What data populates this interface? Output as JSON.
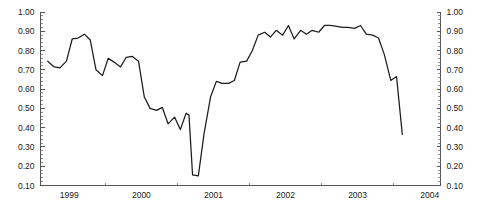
{
  "chart_data": {
    "type": "line",
    "title": "",
    "subtitle": "",
    "xlabel": "",
    "ylabel": "",
    "xlim": [
      1998.6,
      2004.15
    ],
    "ylim": [
      0.1,
      1.0
    ],
    "grid": false,
    "legend": null,
    "y_ticks": [
      "1.00",
      "0.90",
      "0.80",
      "0.70",
      "0.60",
      "0.50",
      "0.40",
      "0.30",
      "0.20",
      "0.10"
    ],
    "y_tick_values": [
      1.0,
      0.9,
      0.8,
      0.7,
      0.6,
      0.5,
      0.4,
      0.3,
      0.2,
      0.1
    ],
    "y_minor_step": 0.02,
    "right_axis_ticks": [
      "1.00",
      "0.90",
      "0.80",
      "0.70",
      "0.60",
      "0.50",
      "0.40",
      "0.30",
      "0.20",
      "0.10"
    ],
    "x_ticks": [
      "1999",
      "2000",
      "2001",
      "2002",
      "2003",
      "2004"
    ],
    "x_tick_values": [
      1999,
      2000,
      2001,
      2002,
      2003,
      2004
    ],
    "series": [
      {
        "name": "series-1",
        "color": "#1d1d1d",
        "x": [
          1998.7,
          1998.79,
          1998.87,
          1998.96,
          1999.04,
          1999.12,
          1999.21,
          1999.29,
          1999.37,
          1999.46,
          1999.54,
          1999.62,
          1999.71,
          1999.79,
          1999.87,
          1999.96,
          2000.04,
          2000.12,
          2000.21,
          2000.29,
          2000.37,
          2000.46,
          2000.54,
          2000.62,
          2000.66,
          2000.71,
          2000.79,
          2000.87,
          2000.96,
          2001.04,
          2001.12,
          2001.21,
          2001.29,
          2001.37,
          2001.46,
          2001.54,
          2001.62,
          2001.71,
          2001.79,
          2001.87,
          2001.96,
          2002.04,
          2002.12,
          2002.21,
          2002.29,
          2002.37,
          2002.46,
          2002.54,
          2002.62,
          2002.71,
          2002.79,
          2002.87,
          2002.96,
          3003.04,
          2003.12,
          2003.21,
          2003.29,
          2003.37,
          2003.46,
          2003.54,
          2003.62
        ],
        "values": [
          0.745,
          0.715,
          0.71,
          0.745,
          0.86,
          0.865,
          0.885,
          0.855,
          0.7,
          0.67,
          0.76,
          0.74,
          0.715,
          0.765,
          0.77,
          0.745,
          0.56,
          0.5,
          0.49,
          0.505,
          0.42,
          0.455,
          0.39,
          0.475,
          0.465,
          0.155,
          0.15,
          0.37,
          0.56,
          0.64,
          0.63,
          0.63,
          0.645,
          0.74,
          0.745,
          0.8,
          0.88,
          0.895,
          0.87,
          0.905,
          0.88,
          0.93,
          0.86,
          0.905,
          0.885,
          0.905,
          0.895,
          0.93,
          0.93,
          0.925,
          0.92,
          0.92,
          0.915,
          0.93,
          0.885,
          0.88,
          0.865,
          0.78,
          0.645,
          0.665,
          0.365
        ]
      }
    ]
  }
}
